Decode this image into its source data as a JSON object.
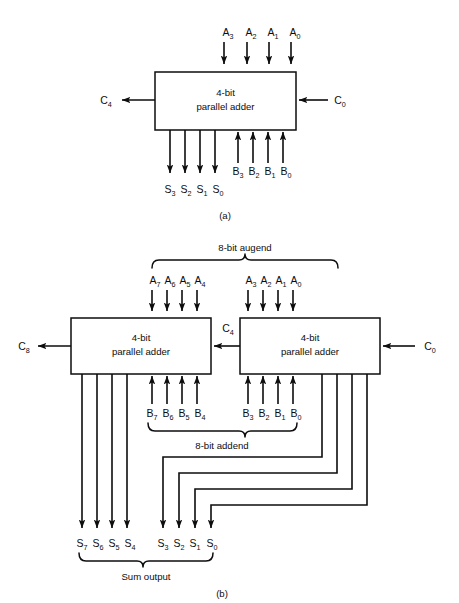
{
  "figure": {
    "captions": {
      "a": "(a)",
      "b": "(b)"
    },
    "block_label_line1": "4-bit",
    "block_label_line2": "parallel adder",
    "colors": {
      "line": "#0d0d0d",
      "background": "#ffffff",
      "box_fill": "#ffffff"
    }
  },
  "diagram_a": {
    "caption": "(a)",
    "block": {
      "line1": "4-bit",
      "line2": "parallel adder"
    },
    "inputs_a": [
      "A",
      "A",
      "A",
      "A"
    ],
    "inputs_a_sub": [
      "3",
      "2",
      "1",
      "0"
    ],
    "inputs_b": [
      "B",
      "B",
      "B",
      "B"
    ],
    "inputs_b_sub": [
      "3",
      "2",
      "1",
      "0"
    ],
    "outputs_s": [
      "S",
      "S",
      "S",
      "S"
    ],
    "outputs_s_sub": [
      "3",
      "2",
      "1",
      "0"
    ],
    "carry_out": {
      "label": "C",
      "sub": "4"
    },
    "carry_in": {
      "label": "C",
      "sub": "0"
    }
  },
  "diagram_b": {
    "caption": "(b)",
    "augend_label": "8-bit augend",
    "addend_label": "8-bit addend",
    "sum_label": "Sum output",
    "left_block": {
      "line1": "4-bit",
      "line2": "parallel adder"
    },
    "right_block": {
      "line1": "4-bit",
      "line2": "parallel adder"
    },
    "inputs_a_high": [
      "A",
      "A",
      "A",
      "A"
    ],
    "inputs_a_high_sub": [
      "7",
      "6",
      "5",
      "4"
    ],
    "inputs_a_low": [
      "A",
      "A",
      "A",
      "A"
    ],
    "inputs_a_low_sub": [
      "3",
      "2",
      "1",
      "0"
    ],
    "inputs_b_high": [
      "B",
      "B",
      "B",
      "B"
    ],
    "inputs_b_high_sub": [
      "7",
      "6",
      "5",
      "4"
    ],
    "inputs_b_low": [
      "B",
      "B",
      "B",
      "B"
    ],
    "inputs_b_low_sub": [
      "3",
      "2",
      "1",
      "0"
    ],
    "outputs_s_high": [
      "S",
      "S",
      "S",
      "S"
    ],
    "outputs_s_high_sub": [
      "7",
      "6",
      "5",
      "4"
    ],
    "outputs_s_low": [
      "S",
      "S",
      "S",
      "S"
    ],
    "outputs_s_low_sub": [
      "3",
      "2",
      "1",
      "0"
    ],
    "carry_out": {
      "label": "C",
      "sub": "8"
    },
    "carry_mid": {
      "label": "C",
      "sub": "4"
    },
    "carry_in": {
      "label": "C",
      "sub": "0"
    }
  }
}
